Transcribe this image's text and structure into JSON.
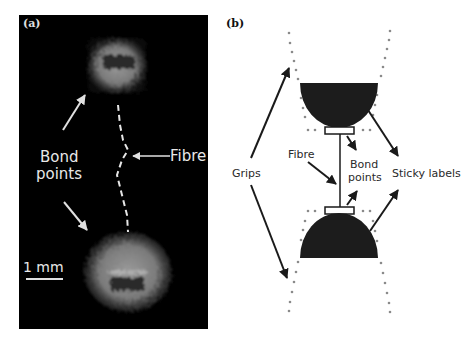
{
  "figure": {
    "panel_a": {
      "label": "(a)",
      "annotations": {
        "bond_points_line1": "Bond",
        "bond_points_line2": "points",
        "fibre": "Fibre",
        "scale_bar": "1 mm"
      },
      "background_color": "#000000",
      "text_color": "#e8e8e8"
    },
    "panel_b": {
      "label": "(b)",
      "annotations": {
        "grips": "Grips",
        "fibre": "Fibre",
        "bond_points_line1": "Bond",
        "bond_points_line2": "points",
        "sticky_labels": "Sticky labels"
      },
      "shape_color": "#1c1c1c",
      "dot_color": "#8a8a8a",
      "arrow_color": "#1a1a1a"
    }
  }
}
